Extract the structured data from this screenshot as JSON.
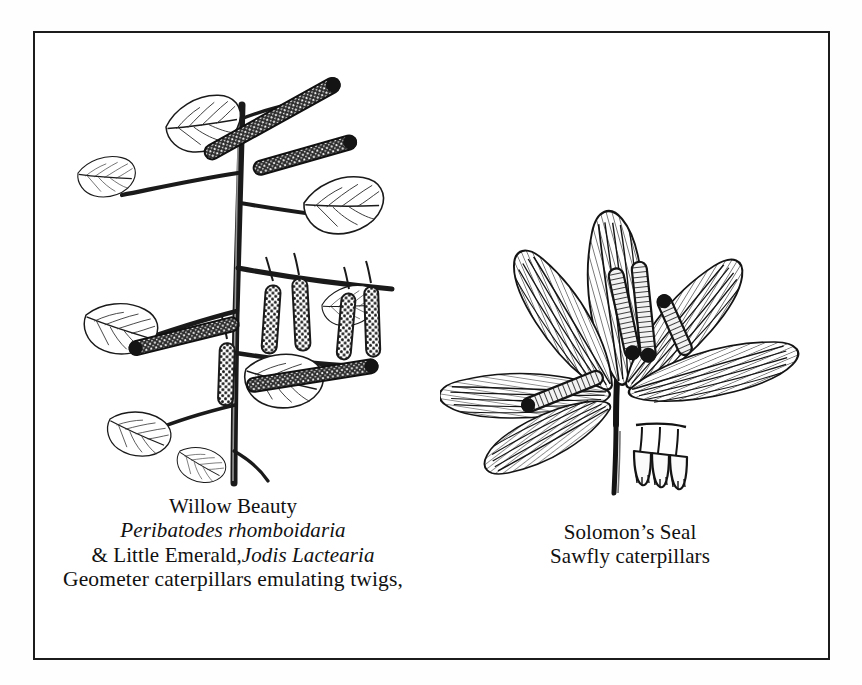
{
  "plate": {
    "background_color": "#fefefe",
    "frame_color": "#1c1c1c",
    "ink_color": "#1a1a1a"
  },
  "figures": [
    {
      "id": "birch-branch-geometer",
      "name": "Birch branch with catkins, leaves and geometer caterpillars",
      "subject": "Willow Beauty and Little Emerald geometer caterpillars posed as twigs on a birch spray",
      "elements": [
        "branch",
        "leaves",
        "catkins",
        "caterpillars"
      ],
      "style": "pen-and-ink line drawing"
    },
    {
      "id": "solomons-seal-sawfly",
      "name": "Solomon's Seal plant with sawfly caterpillars",
      "subject": "Sawfly caterpillars feeding on Solomon's Seal leaves above hanging bell flowers",
      "elements": [
        "arching stem",
        "parallel-veined leaves",
        "bell flowers",
        "caterpillars"
      ],
      "style": "pen-and-ink line drawing"
    }
  ],
  "caption_left": {
    "line1": "Willow Beauty",
    "line2": "Peribatodes  rhomboidaria",
    "line3_roman": "& Little Emerald,",
    "line3_italic": "Jodis Lactearia",
    "line4": "Geometer caterpillars emulating twigs,"
  },
  "caption_right": {
    "line1": "Solomon’s Seal",
    "line2": "Sawfly caterpillars"
  }
}
